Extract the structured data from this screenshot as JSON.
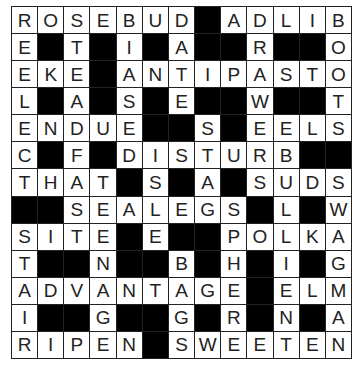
{
  "puzzle": {
    "rows": 13,
    "cols": 13,
    "colors": {
      "block": "#000000",
      "cell": "#ffffff",
      "text": "#222222",
      "grid_line": "#222222"
    },
    "grid": [
      [
        "R",
        "O",
        "S",
        "E",
        "B",
        "U",
        "D",
        "#",
        "A",
        "D",
        "L",
        "I",
        "B"
      ],
      [
        "E",
        "#",
        "T",
        "#",
        "I",
        "#",
        "A",
        "#",
        "#",
        "R",
        "#",
        "#",
        "O"
      ],
      [
        "E",
        "K",
        "E",
        "#",
        "A",
        "N",
        "T",
        "I",
        "P",
        "A",
        "S",
        "T",
        "O"
      ],
      [
        "L",
        "#",
        "A",
        "#",
        "S",
        "#",
        "E",
        "#",
        "#",
        "W",
        "#",
        "#",
        "T"
      ],
      [
        "E",
        "N",
        "D",
        "U",
        "E",
        "#",
        "#",
        "S",
        "#",
        "E",
        "E",
        "L",
        "S"
      ],
      [
        "C",
        "#",
        "F",
        "#",
        "D",
        "I",
        "S",
        "T",
        "U",
        "R",
        "B",
        "#",
        "#"
      ],
      [
        "T",
        "H",
        "A",
        "T",
        "#",
        "S",
        "#",
        "A",
        "#",
        "S",
        "U",
        "D",
        "S"
      ],
      [
        "#",
        "#",
        "S",
        "E",
        "A",
        "L",
        "E",
        "G",
        "S",
        "#",
        "L",
        "#",
        "W"
      ],
      [
        "S",
        "I",
        "T",
        "E",
        "#",
        "E",
        "#",
        "#",
        "P",
        "O",
        "L",
        "K",
        "A"
      ],
      [
        "T",
        "#",
        "#",
        "N",
        "#",
        "#",
        "B",
        "#",
        "H",
        "#",
        "I",
        "#",
        "G"
      ],
      [
        "A",
        "D",
        "V",
        "A",
        "N",
        "T",
        "A",
        "G",
        "E",
        "#",
        "E",
        "L",
        "M"
      ],
      [
        "I",
        "#",
        "#",
        "G",
        "#",
        "#",
        "G",
        "#",
        "R",
        "#",
        "N",
        "#",
        "A"
      ],
      [
        "R",
        "I",
        "P",
        "E",
        "N",
        "#",
        "S",
        "W",
        "E",
        "E",
        "T",
        "E",
        "N"
      ]
    ]
  }
}
